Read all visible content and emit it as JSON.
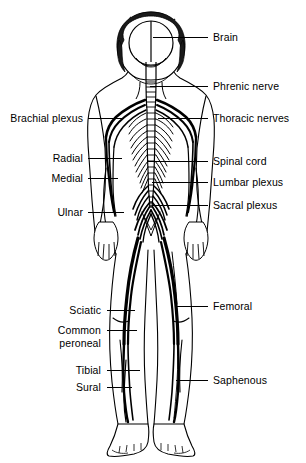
{
  "figure": {
    "width": 306,
    "height": 463,
    "background_color": "#ffffff",
    "line_color": "#000000",
    "text_color": "#000000"
  },
  "labels": {
    "left": [
      {
        "text": "Brachial plexus",
        "x_end": 83,
        "y": 118,
        "leader_x1": 88,
        "leader_x2": 124
      },
      {
        "text": "Radial",
        "x_end": 83,
        "y": 158,
        "leader_x1": 88,
        "leader_x2": 122
      },
      {
        "text": "Medial",
        "x_end": 83,
        "y": 178,
        "leader_x1": 88,
        "leader_x2": 118
      },
      {
        "text": "Ulnar",
        "x_end": 83,
        "y": 212,
        "leader_x1": 88,
        "leader_x2": 124
      },
      {
        "text": "Sciatic",
        "x_end": 101,
        "y": 310,
        "leader_x1": 107,
        "leader_x2": 135
      },
      {
        "text": "Common peroneal",
        "x_end": 101,
        "y": 336,
        "leader_x1": 107,
        "leader_x2": 137,
        "lines": [
          "Common",
          "peroneal"
        ],
        "two_line": true
      },
      {
        "text": "Tibial",
        "x_end": 101,
        "y": 370,
        "leader_x1": 107,
        "leader_x2": 140
      },
      {
        "text": "Sural",
        "x_end": 101,
        "y": 387,
        "leader_x1": 107,
        "leader_x2": 132
      }
    ],
    "right": [
      {
        "text": "Brain",
        "x_start": 213,
        "y": 37,
        "leader_x1": 153,
        "leader_x2": 208
      },
      {
        "text": "Phrenic nerve",
        "x_start": 213,
        "y": 86,
        "leader_x1": 150,
        "leader_x2": 208
      },
      {
        "text": "Thoracic nerves",
        "x_start": 213,
        "y": 118,
        "leader_x1": 158,
        "leader_x2": 208
      },
      {
        "text": "Spinal cord",
        "x_start": 213,
        "y": 161,
        "leader_x1": 148,
        "leader_x2": 208
      },
      {
        "text": "Lumbar plexus",
        "x_start": 213,
        "y": 182,
        "leader_x1": 152,
        "leader_x2": 208
      },
      {
        "text": "Sacral plexus",
        "x_start": 213,
        "y": 205,
        "leader_x1": 152,
        "leader_x2": 208
      },
      {
        "text": "Femoral",
        "x_start": 213,
        "y": 306,
        "leader_x1": 176,
        "leader_x2": 208
      },
      {
        "text": "Saphenous",
        "x_start": 213,
        "y": 380,
        "leader_x1": 176,
        "leader_x2": 208
      }
    ]
  },
  "anatomy": {
    "parts": [
      "head-with-hair",
      "brain",
      "spinal-cord",
      "thoracic-nerve-branches",
      "brachial-plexus",
      "arm-nerves",
      "lumbar-plexus",
      "sacral-plexus",
      "sciatic-nerve",
      "leg-nerves",
      "body-outline",
      "feet"
    ]
  }
}
